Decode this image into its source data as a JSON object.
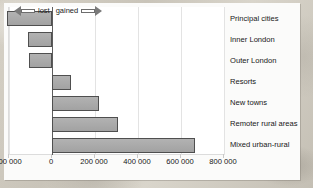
{
  "chart_data": {
    "type": "bar",
    "orientation": "horizontal",
    "title": "",
    "xlabel": "",
    "ylabel": "",
    "xlim": [
      -200000,
      800000
    ],
    "grid": true,
    "legend": "none",
    "categories": [
      "Principal cities",
      "Inner London",
      "Outer London",
      "Resorts",
      "New towns",
      "Remoter rural areas",
      "Mixed urban-rural"
    ],
    "values": [
      -210000,
      -113000,
      -105000,
      88000,
      217000,
      307000,
      667000
    ],
    "tick_labels": [
      "200 000",
      "0",
      "200 000",
      "400 000",
      "600 000",
      "800 000"
    ],
    "tick_values": [
      -200000,
      0,
      200000,
      400000,
      600000,
      800000
    ],
    "annotations": {
      "lost_label": "lost",
      "gained_label": "gained"
    },
    "colors": {
      "bar_fill": "#a8a8a8",
      "bar_stroke": "#4f4f4f",
      "plot_background": "#ffffff",
      "grid": "#e3e3e3",
      "zero_axis": "#5d5d5d",
      "text": "#171717",
      "page_background": "#cfcabf"
    }
  }
}
